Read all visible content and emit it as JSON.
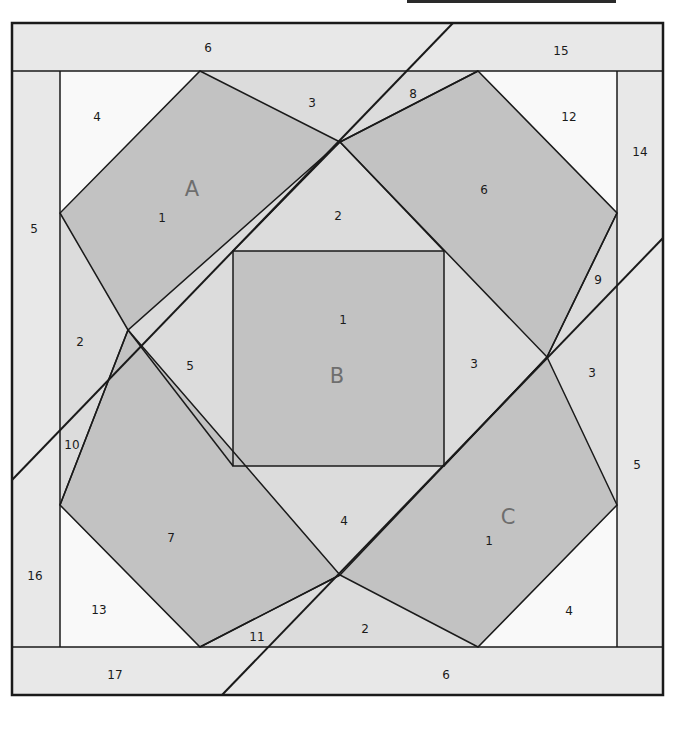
{
  "diagram": {
    "type": "quilt-paper-piecing-pattern",
    "colors": {
      "border_band": "#e8e8e8",
      "background_light": "#dcdcdc",
      "white_piece": "#f9f9f9",
      "dark_piece": "#c2c2c2",
      "line": "#1a1a1a",
      "section_letter": "#6e6e6e"
    },
    "sections": {
      "A": {
        "letter": "A"
      },
      "B": {
        "letter": "B"
      },
      "C": {
        "letter": "C"
      }
    },
    "labels": {
      "top_band_6": "6",
      "top_band_15": "15",
      "left_col_5": "5",
      "left_col_16": "16",
      "right_col_14": "14",
      "right_col_5": "5",
      "bottom_band_17": "17",
      "bottom_band_6": "6",
      "a_4": "4",
      "a_3": "3",
      "a_1": "1",
      "a_2": "2",
      "a_8": "8",
      "a_12": "12",
      "a_6": "6",
      "a_10": "10",
      "b_2": "2",
      "b_1": "1",
      "b_5": "5",
      "b_3": "3",
      "b_4": "4",
      "c_9": "9",
      "c_3": "3",
      "c_7": "7",
      "c_1": "1",
      "c_13": "13",
      "c_11": "11",
      "c_2": "2",
      "c_4": "4"
    }
  }
}
